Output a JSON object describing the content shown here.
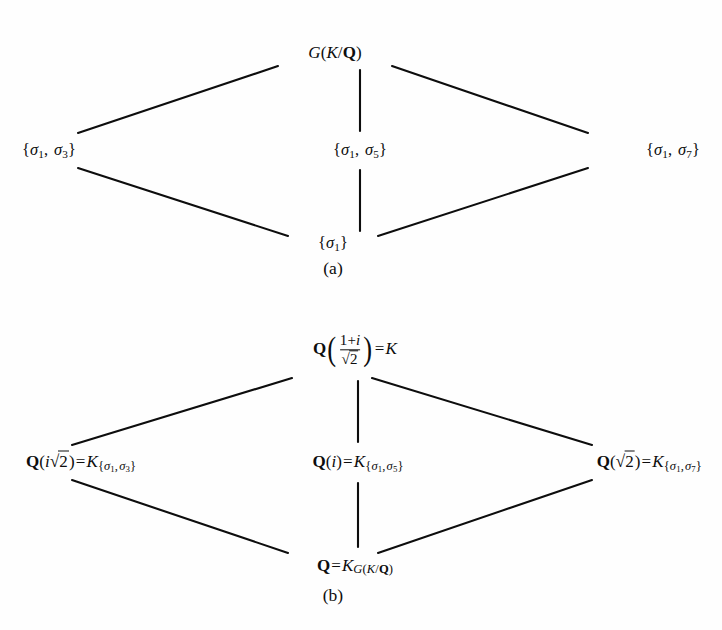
{
  "figure": {
    "background_color": "#fefefe",
    "ink_color": "#0d0d0d",
    "diagrams": [
      {
        "id": "a",
        "caption": "(a)",
        "description": "Lattice of subgroups of the Galois group G(K/Q)",
        "nodes": {
          "top": "G(K/Q)",
          "left": "{sigma_1, sigma_3}",
          "center": "{sigma_1, sigma_5}",
          "right": "{sigma_1, sigma_7}",
          "bottom": "{sigma_1}"
        },
        "edges": [
          [
            "top",
            "left"
          ],
          [
            "top",
            "center"
          ],
          [
            "top",
            "right"
          ],
          [
            "left",
            "bottom"
          ],
          [
            "center",
            "bottom"
          ],
          [
            "right",
            "bottom"
          ]
        ]
      },
      {
        "id": "b",
        "caption": "(b)",
        "description": "Lattice of fixed fields corresponding to the subgroups",
        "nodes": {
          "top": "Q((1+i)/sqrt2) = K",
          "left": "Q(i sqrt2) = K_{sigma_1, sigma_3}",
          "center": "Q(i) = K_{sigma_1, sigma_5}",
          "right": "Q(sqrt2) = K_{sigma_1, sigma_7}",
          "bottom": "Q = K_{G(K/Q)}"
        },
        "edges": [
          [
            "top",
            "left"
          ],
          [
            "top",
            "center"
          ],
          [
            "top",
            "right"
          ],
          [
            "left",
            "bottom"
          ],
          [
            "center",
            "bottom"
          ],
          [
            "right",
            "bottom"
          ]
        ]
      }
    ],
    "symbols": {
      "group_letter": "G",
      "field_letter": "K",
      "rationals": "Q",
      "automorphism": "sigma",
      "imaginary_unit": "i",
      "indices": [
        1,
        3,
        5,
        7
      ],
      "radicand": "2",
      "numerator": "1+i"
    },
    "labels": {
      "caption_a": "(a)",
      "caption_b": "(b)",
      "G": "G",
      "K": "K",
      "Q": "Q",
      "i": "i",
      "sigma": "σ",
      "equals": "=",
      "slash": "/",
      "lbrace": "{",
      "rbrace": "}",
      "comma": ",",
      "lparen": "(",
      "rparen": ")",
      "plus": "+",
      "radical": "√",
      "two": "2",
      "one": "1",
      "idx1": "1",
      "idx3": "3",
      "idx5": "5",
      "idx7": "7"
    }
  }
}
